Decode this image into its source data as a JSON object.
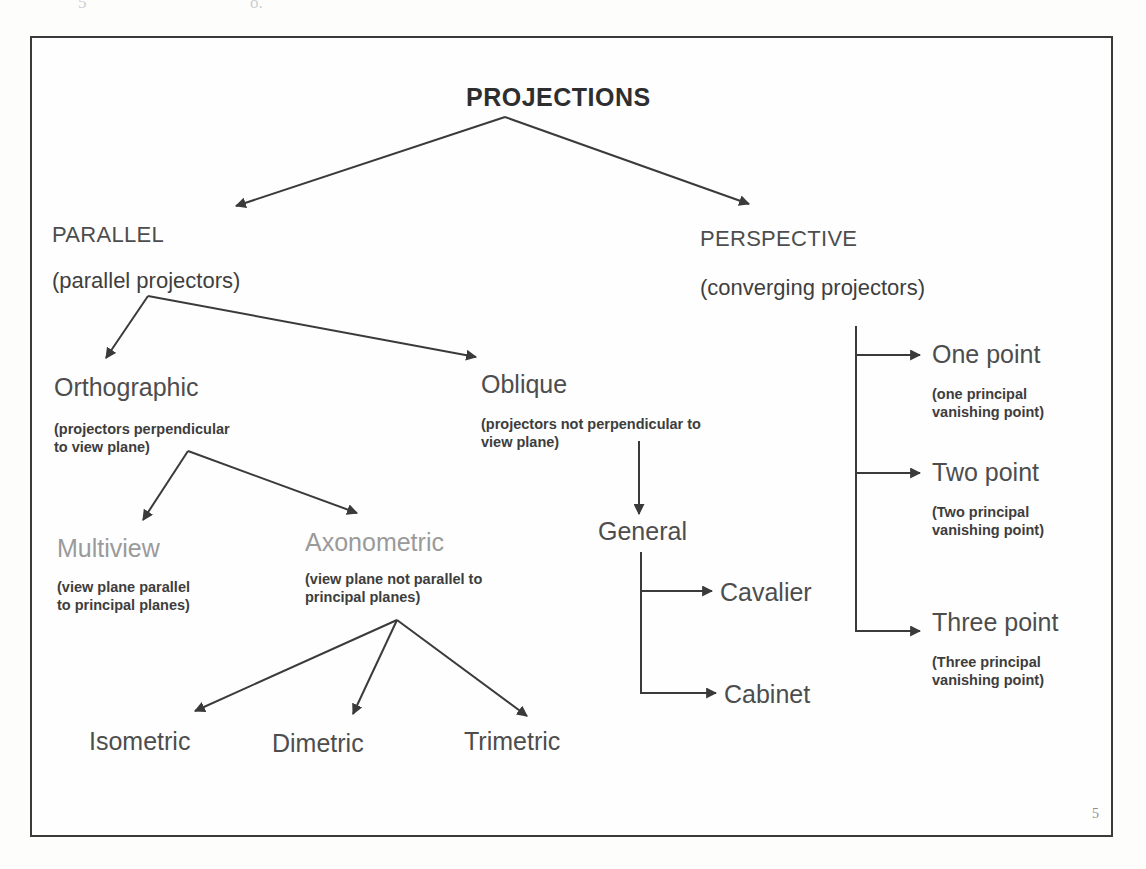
{
  "page": {
    "page_number": "5",
    "scan_artifact_left": "5",
    "scan_artifact_mid": "o."
  },
  "diagram": {
    "title": "PROJECTIONS",
    "nodes": {
      "parallel": {
        "label": "PARALLEL",
        "sublabel": "(parallel projectors)"
      },
      "perspective": {
        "label": "PERSPECTIVE",
        "sublabel": "(converging projectors)"
      },
      "orthographic": {
        "label": "Orthographic",
        "note": "(projectors perpendicular\nto view plane)"
      },
      "oblique": {
        "label": "Oblique",
        "note": "(projectors not perpendicular to\nview plane)"
      },
      "multiview": {
        "label": "Multiview",
        "note": "(view plane parallel\nto principal planes)"
      },
      "axonometric": {
        "label": "Axonometric",
        "note": "(view plane not parallel to\nprincipal planes)"
      },
      "isometric": {
        "label": "Isometric"
      },
      "dimetric": {
        "label": "Dimetric"
      },
      "trimetric": {
        "label": "Trimetric"
      },
      "general": {
        "label": "General"
      },
      "cavalier": {
        "label": "Cavalier"
      },
      "cabinet": {
        "label": "Cabinet"
      },
      "one_point": {
        "label": "One point",
        "note": "(one principal\nvanishing point)"
      },
      "two_point": {
        "label": "Two point",
        "note": "(Two principal\nvanishing point)"
      },
      "three_point": {
        "label": "Three point",
        "note": "(Three principal\nvanishing point)"
      }
    },
    "colors": {
      "ink": "#4d4d4d",
      "faded_ink": "#9a9a9a",
      "line": "#3a3a3a",
      "frame": "#3a3a3a",
      "background": "#fefefe"
    }
  }
}
